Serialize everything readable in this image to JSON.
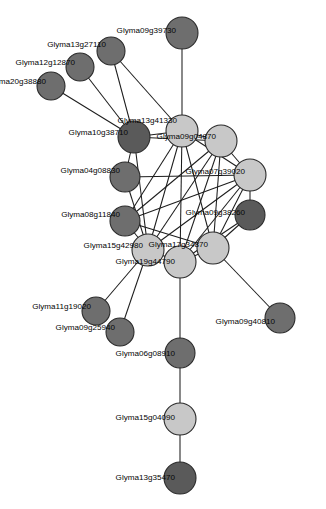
{
  "figure": {
    "type": "network-graph",
    "title": "",
    "background_color": "#ffffff",
    "width": 326,
    "height": 509
  },
  "style": {
    "node_stroke": "#2b2b2b",
    "edge_color": "#1d1d1d",
    "label_color": "#050505",
    "shade_light": "#c8c8c8",
    "shade_medium": "#949494",
    "shade_dark": "#6e6e6e",
    "shade_darkest": "#5a5a5a"
  },
  "chart_data": {
    "type": "scatter",
    "title": "",
    "xlabel": "",
    "ylabel": "",
    "nodes": [
      {
        "id": "n1",
        "label": "Glyma09g39730",
        "x": 182,
        "y": 33,
        "r": 16,
        "shade": "#6e6e6e",
        "label_x": 176,
        "label_y": 31,
        "anchor": "end"
      },
      {
        "id": "n2",
        "label": "Glyma13g27110",
        "x": 111,
        "y": 51,
        "r": 14,
        "shade": "#6e6e6e",
        "label_x": 106,
        "label_y": 45,
        "anchor": "end"
      },
      {
        "id": "n3",
        "label": "Glyma12g12870",
        "x": 80,
        "y": 67,
        "r": 14,
        "shade": "#6e6e6e",
        "label_x": 75,
        "label_y": 63,
        "anchor": "end"
      },
      {
        "id": "n4",
        "label": "Glyma20g38880",
        "x": 51,
        "y": 86,
        "r": 14,
        "shade": "#6e6e6e",
        "label_x": 46,
        "label_y": 82,
        "anchor": "end"
      },
      {
        "id": "n5",
        "label": "Glyma10g38710",
        "x": 134,
        "y": 137,
        "r": 16,
        "shade": "#5a5a5a",
        "label_x": 128,
        "label_y": 133,
        "anchor": "end"
      },
      {
        "id": "n6",
        "label": "Glyma13g41330",
        "x": 182,
        "y": 131,
        "r": 16,
        "shade": "#c8c8c8",
        "label_x": 177,
        "label_y": 121,
        "anchor": "end"
      },
      {
        "id": "n7",
        "label": "Glyma09g04870",
        "x": 221,
        "y": 141,
        "r": 16,
        "shade": "#c8c8c8",
        "label_x": 216,
        "label_y": 137,
        "anchor": "end"
      },
      {
        "id": "n8",
        "label": "Glyma04g08830",
        "x": 125,
        "y": 177,
        "r": 15,
        "shade": "#6e6e6e",
        "label_x": 120,
        "label_y": 171,
        "anchor": "end"
      },
      {
        "id": "n9",
        "label": "Glyma07g39020",
        "x": 250,
        "y": 175,
        "r": 16,
        "shade": "#c8c8c8",
        "label_x": 245,
        "label_y": 172,
        "anchor": "end"
      },
      {
        "id": "n10",
        "label": "Glyma08g11840",
        "x": 125,
        "y": 221,
        "r": 15,
        "shade": "#6e6e6e",
        "label_x": 120,
        "label_y": 215,
        "anchor": "end"
      },
      {
        "id": "n11",
        "label": "Glyma09g38260",
        "x": 250,
        "y": 215,
        "r": 15,
        "shade": "#5a5a5a",
        "label_x": 245,
        "label_y": 213,
        "anchor": "end"
      },
      {
        "id": "n12",
        "label": "Glyma15g42980",
        "x": 148,
        "y": 250,
        "r": 16,
        "shade": "#c8c8c8",
        "label_x": 143,
        "label_y": 246,
        "anchor": "end"
      },
      {
        "id": "n13",
        "label": "Glyma17g34870",
        "x": 213,
        "y": 248,
        "r": 16,
        "shade": "#c8c8c8",
        "label_x": 208,
        "label_y": 245,
        "anchor": "end"
      },
      {
        "id": "n14",
        "label": "Glyma19g44790",
        "x": 180,
        "y": 262,
        "r": 16,
        "shade": "#c8c8c8",
        "label_x": 175,
        "label_y": 262,
        "anchor": "end"
      },
      {
        "id": "n15",
        "label": "Glyma11g19020",
        "x": 96,
        "y": 311,
        "r": 14,
        "shade": "#6e6e6e",
        "label_x": 91,
        "label_y": 307,
        "anchor": "end"
      },
      {
        "id": "n16",
        "label": "Glyma09g25940",
        "x": 120,
        "y": 332,
        "r": 14,
        "shade": "#6e6e6e",
        "label_x": 115,
        "label_y": 328,
        "anchor": "end"
      },
      {
        "id": "n17",
        "label": "Glyma09g40810",
        "x": 280,
        "y": 318,
        "r": 15,
        "shade": "#6e6e6e",
        "label_x": 275,
        "label_y": 322,
        "anchor": "end"
      },
      {
        "id": "n18",
        "label": "Glyma06g08910",
        "x": 180,
        "y": 353,
        "r": 15,
        "shade": "#6e6e6e",
        "label_x": 175,
        "label_y": 354,
        "anchor": "end"
      },
      {
        "id": "n19",
        "label": "Glyma15g04090",
        "x": 180,
        "y": 419,
        "r": 16,
        "shade": "#c8c8c8",
        "label_x": 175,
        "label_y": 418,
        "anchor": "end"
      },
      {
        "id": "n20",
        "label": "Glyma13g35470",
        "x": 180,
        "y": 478,
        "r": 16,
        "shade": "#5a5a5a",
        "label_x": 175,
        "label_y": 478,
        "anchor": "end"
      }
    ],
    "edges": [
      {
        "source": "n1",
        "target": "n6"
      },
      {
        "source": "n2",
        "target": "n5"
      },
      {
        "source": "n3",
        "target": "n5"
      },
      {
        "source": "n4",
        "target": "n5"
      },
      {
        "source": "n2",
        "target": "n6"
      },
      {
        "source": "n5",
        "target": "n6"
      },
      {
        "source": "n5",
        "target": "n7"
      },
      {
        "source": "n5",
        "target": "n8"
      },
      {
        "source": "n5",
        "target": "n12"
      },
      {
        "source": "n6",
        "target": "n7"
      },
      {
        "source": "n6",
        "target": "n9"
      },
      {
        "source": "n6",
        "target": "n12"
      },
      {
        "source": "n6",
        "target": "n13"
      },
      {
        "source": "n6",
        "target": "n14"
      },
      {
        "source": "n6",
        "target": "n10"
      },
      {
        "source": "n7",
        "target": "n9"
      },
      {
        "source": "n7",
        "target": "n12"
      },
      {
        "source": "n7",
        "target": "n13"
      },
      {
        "source": "n7",
        "target": "n14"
      },
      {
        "source": "n7",
        "target": "n10"
      },
      {
        "source": "n8",
        "target": "n9"
      },
      {
        "source": "n8",
        "target": "n12"
      },
      {
        "source": "n9",
        "target": "n10"
      },
      {
        "source": "n9",
        "target": "n11"
      },
      {
        "source": "n9",
        "target": "n12"
      },
      {
        "source": "n9",
        "target": "n13"
      },
      {
        "source": "n9",
        "target": "n14"
      },
      {
        "source": "n10",
        "target": "n12"
      },
      {
        "source": "n10",
        "target": "n13"
      },
      {
        "source": "n11",
        "target": "n13"
      },
      {
        "source": "n11",
        "target": "n14"
      },
      {
        "source": "n12",
        "target": "n14"
      },
      {
        "source": "n12",
        "target": "n15"
      },
      {
        "source": "n12",
        "target": "n16"
      },
      {
        "source": "n13",
        "target": "n14"
      },
      {
        "source": "n13",
        "target": "n17"
      },
      {
        "source": "n14",
        "target": "n18"
      },
      {
        "source": "n18",
        "target": "n19"
      },
      {
        "source": "n19",
        "target": "n20"
      }
    ]
  }
}
